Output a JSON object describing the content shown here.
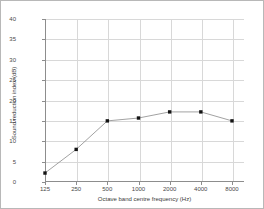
{
  "chart_data": {
    "type": "line",
    "title": "",
    "xlabel": "Octave band centre frequency (Hz)",
    "ylabel": "Sound reduction index (dB)",
    "categories": [
      "125",
      "250",
      "500",
      "1000",
      "2000",
      "4000",
      "8000"
    ],
    "x_tick_labels": [
      "125",
      "250",
      "500",
      "1000",
      "2000",
      "4000",
      "8000"
    ],
    "y_tick_labels": [
      "0",
      "5",
      "10",
      "15",
      "20",
      "25",
      "30",
      "35",
      "40"
    ],
    "y_ticks": [
      0,
      5,
      10,
      15,
      20,
      25,
      30,
      35,
      40
    ],
    "ylim": [
      0,
      40
    ],
    "xscale": "log",
    "grid": true,
    "legend": "none",
    "series": [
      {
        "name": "Sound reduction index",
        "values": [
          2.2,
          8,
          15,
          15.7,
          17.2,
          17.2,
          15
        ],
        "marker": "square",
        "marker_color": "#141414",
        "line_color": "#8a8a8a"
      }
    ]
  },
  "style": {
    "background": "#ffffff",
    "grid_color": "#d8d8d8",
    "axis_color": "#8d8d8d",
    "border_color": "#b8b8b8",
    "tick_text_color": "#4a4a4a",
    "axis_title_color": "#3a3a3a"
  }
}
